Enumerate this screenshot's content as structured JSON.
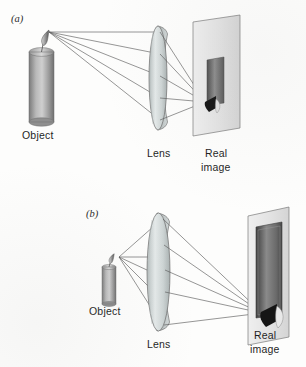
{
  "figure": {
    "background_color": "#fdfdfc",
    "ray_color": "#5d5d5d",
    "ink_color": "#1f1f1f"
  },
  "panels": [
    {
      "id": "a",
      "label": "(a)",
      "description": "Object far from lens forms a small inverted real image on the screen",
      "object_label": "Object",
      "lens_label": "Lens",
      "image_label_line1": "Real",
      "image_label_line2": "image",
      "candle": {
        "fill_light": "#cfcfcf",
        "fill_dark": "#6f6f6f"
      },
      "lens": {
        "fill": "#d8dcdc",
        "stroke": "#6b6b6b"
      },
      "screen": {
        "fill": "#e8e8e8",
        "stroke": "#7a7a7a"
      },
      "image_on_screen": {
        "body_fill": "#7c7c7c",
        "flame_fill": "#151515"
      },
      "ray_count": 5
    },
    {
      "id": "b",
      "label": "(b)",
      "description": "Object close to lens forms a large inverted real image on the screen",
      "object_label": "Object",
      "lens_label": "Lens",
      "image_label_line1": "Real",
      "image_label_line2": "image",
      "candle": {
        "fill_light": "#cfcfcf",
        "fill_dark": "#6f6f6f"
      },
      "lens": {
        "fill": "#d8dcdc",
        "stroke": "#6b6b6b"
      },
      "screen": {
        "fill": "#e8e8e8",
        "stroke": "#7a7a7a"
      },
      "image_on_screen": {
        "body_fill": "#6e6e6e",
        "flame_fill": "#151515"
      },
      "ray_count": 5
    }
  ]
}
